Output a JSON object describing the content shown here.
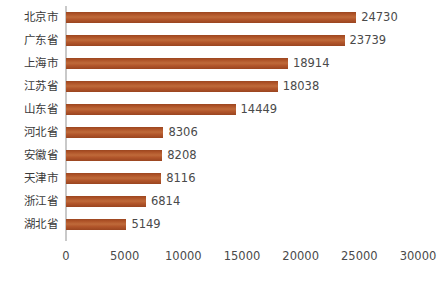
{
  "chart_data": {
    "type": "bar",
    "orientation": "horizontal",
    "title": "",
    "subtitle": "",
    "xlabel": "",
    "ylabel": "",
    "categories": [
      "北京市",
      "广东省",
      "上海市",
      "江苏省",
      "山东省",
      "河北省",
      "安徽省",
      "天津市",
      "浙江省",
      "湖北省"
    ],
    "values": [
      24730,
      23739,
      18914,
      18038,
      14449,
      8306,
      8208,
      8116,
      6814,
      5149
    ],
    "data_labels": [
      "24730",
      "23739",
      "18914",
      "18038",
      "14449",
      "8306",
      "8208",
      "8116",
      "6814",
      "5149"
    ],
    "xlim": [
      0,
      30000
    ],
    "xticks": [
      0,
      5000,
      10000,
      15000,
      20000,
      25000,
      30000
    ],
    "xtick_labels": [
      "0",
      "5000",
      "10000",
      "15000",
      "20000",
      "25000",
      "30000"
    ],
    "grid": false,
    "legend": false,
    "legend_position": "none",
    "series": [
      {
        "name": "",
        "values": [
          24730,
          23739,
          18914,
          18038,
          14449,
          8306,
          8208,
          8116,
          6814,
          5149
        ]
      }
    ],
    "colors": {
      "bar": "#b2542a",
      "bar_highlight": "#bf6a3a",
      "bar_shadow": "#9a4520",
      "axis_line": "#c9c9c9",
      "category_text": "#3a3a3a",
      "value_text": "#4a4a4a",
      "tick_text": "#4a4a4a",
      "background": "#ffffff"
    }
  }
}
